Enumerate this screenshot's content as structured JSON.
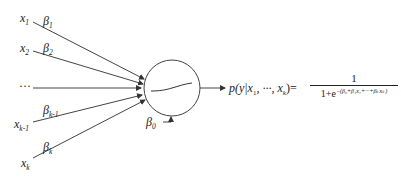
{
  "diagram": {
    "type": "logistic-regression-neuron",
    "inputs": [
      {
        "var": "x",
        "sub": "1",
        "weight": "β",
        "wsub": "1"
      },
      {
        "var": "x",
        "sub": "2",
        "weight": "β",
        "wsub": "2"
      },
      {
        "var": "···",
        "sub": "",
        "weight": "",
        "wsub": ""
      },
      {
        "var": "x",
        "sub": "k-1",
        "weight": "β",
        "wsub": "k-1"
      },
      {
        "var": "x",
        "sub": "k",
        "weight": "β",
        "wsub": "k"
      }
    ],
    "bias": {
      "symbol": "β",
      "sub": "0"
    },
    "node": {
      "shape": "circle",
      "activation": "sigmoid-curve"
    },
    "output": {
      "lhs_p": "p",
      "lhs_args": "(y|x",
      "lhs_sub1": "1",
      "lhs_mid": ", ···, x",
      "lhs_subk": "k",
      "lhs_close": ")",
      "equals": "=",
      "numerator": "1",
      "denominator_base": "1+e",
      "denominator_exp": "−(β₀+β₁x₁+···+βₖxₖ)"
    },
    "colors": {
      "stroke": "#333333",
      "text": "#222222",
      "background": "#ffffff"
    }
  }
}
